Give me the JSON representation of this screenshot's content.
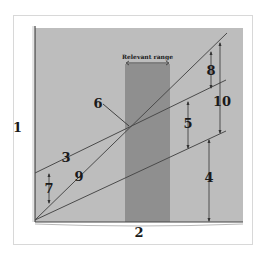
{
  "diagram": {
    "colors": {
      "plot_bg": "#bdbdbd",
      "relevant_range": "#8f8f8f",
      "line": "#4a4a4a",
      "text": "#1a1a1a"
    },
    "relevant_range_label": "Relevant range",
    "labels": {
      "y_axis": "1",
      "x_axis": "2",
      "total_cost_line": "3",
      "variable_cost_gap": "4",
      "profit_area_gap": "5",
      "break_even_point": "6",
      "fixed_cost_gap": "7",
      "profit_gap": "8",
      "total_revenue_line": "9",
      "total_revenue_gap": "10"
    }
  }
}
